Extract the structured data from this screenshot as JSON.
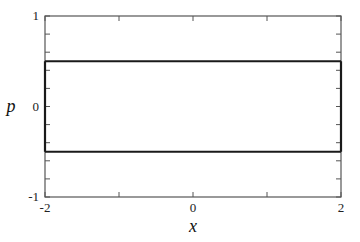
{
  "chart_data": {
    "type": "line",
    "title": "",
    "xlabel": "x",
    "ylabel": "p",
    "xlim": [
      -2,
      2
    ],
    "ylim": [
      -1,
      1
    ],
    "grid": false,
    "legend": null,
    "x_ticks": [
      -2,
      0,
      2
    ],
    "x_tick_labels": [
      "-2",
      "0",
      "2"
    ],
    "x_minor_ticks": [
      -1,
      1
    ],
    "y_ticks": [
      -1,
      0,
      1
    ],
    "y_tick_labels": [
      "-1",
      "0",
      "1"
    ],
    "y_minor_ticks": [
      -0.8,
      -0.6,
      -0.4,
      -0.2,
      0.2,
      0.4,
      0.6,
      0.8
    ],
    "series": [
      {
        "name": "upper boundary",
        "x": [
          -2,
          2
        ],
        "y": [
          0.5,
          0.5
        ]
      },
      {
        "name": "lower boundary",
        "x": [
          -2,
          2
        ],
        "y": [
          -0.5,
          -0.5
        ]
      },
      {
        "name": "left boundary",
        "x": [
          -2,
          -2
        ],
        "y": [
          -0.5,
          0.5
        ]
      },
      {
        "name": "right boundary",
        "x": [
          2,
          2
        ],
        "y": [
          -0.5,
          0.5
        ]
      }
    ]
  }
}
